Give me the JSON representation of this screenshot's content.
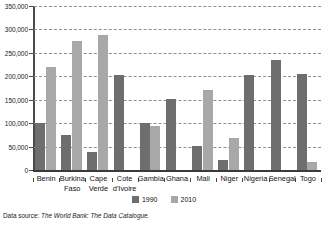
{
  "chart_data": {
    "type": "bar",
    "title": "",
    "subtitle": "",
    "xlabel": "",
    "ylabel": "",
    "categories": [
      "Benin",
      "Burkina Faso",
      "Cape Verde",
      "Cote d'Ivoire",
      "Gambia",
      "Ghana",
      "Mali",
      "Niger",
      "Nigeria",
      "Senegal",
      "Togo"
    ],
    "category_lines": [
      [
        "Benin"
      ],
      [
        "Burkina",
        "Faso"
      ],
      [
        "Cape",
        "Verde"
      ],
      [
        "Cote",
        "d'Ivoire"
      ],
      [
        "Gambia"
      ],
      [
        "Ghana"
      ],
      [
        "Mali"
      ],
      [
        "Niger"
      ],
      [
        "Nigeria"
      ],
      [
        "Senegal"
      ],
      [
        "Togo"
      ]
    ],
    "series": [
      {
        "name": "1990",
        "color": "#6e6e6e",
        "values": [
          100000,
          75000,
          40000,
          203000,
          102000,
          153000,
          53000,
          22000,
          204000,
          235000,
          205000
        ]
      },
      {
        "name": "2010",
        "color": "#a8a8a8",
        "values": [
          220000,
          275000,
          288000,
          null,
          95000,
          null,
          172000,
          70000,
          null,
          null,
          18000
        ]
      }
    ],
    "ylim": [
      0,
      350000
    ],
    "yticks": [
      0,
      50000,
      100000,
      150000,
      200000,
      250000,
      300000,
      350000
    ],
    "ytick_labels": [
      "0",
      "50,000",
      "100,000",
      "150,000",
      "200,000",
      "250,000",
      "300,000",
      "350,000"
    ],
    "grid": true,
    "grid_axis": "y",
    "grid_style": "dashed",
    "legend_position": "bottom-center"
  },
  "legend": {
    "items": [
      {
        "label": "1990",
        "color": "#6e6e6e"
      },
      {
        "label": "2010",
        "color": "#a8a8a8"
      }
    ]
  },
  "source": {
    "label": "Data source: ",
    "value": "The World Bank: The Data Catalogue."
  }
}
